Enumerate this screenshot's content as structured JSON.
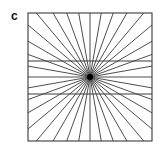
{
  "figure": {
    "panel_label": "c",
    "square": {
      "x": 28,
      "y": 13,
      "width": 124,
      "height": 128
    },
    "center": {
      "x": 90,
      "y": 77
    },
    "spoke_angle_step_deg": 10,
    "horizontal_lines_y": [
      61,
      94
    ],
    "line_color": "#3a3a3a",
    "center_color": "#000000"
  }
}
